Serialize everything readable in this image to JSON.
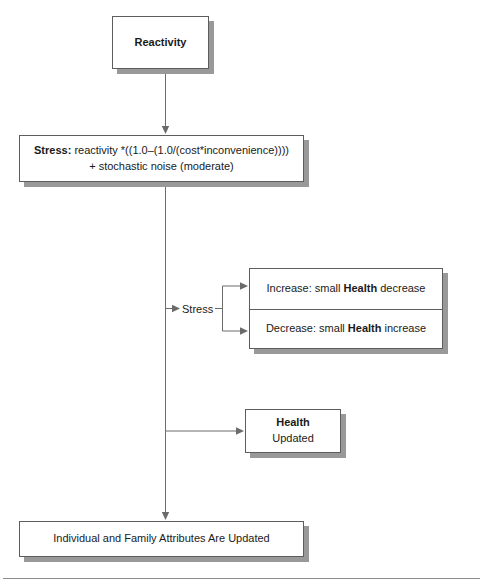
{
  "diagram": {
    "type": "flowchart",
    "nodes": {
      "reactivity": {
        "label": "Reactivity"
      },
      "stress_formula": {
        "line1_bold": "Stress:",
        "line1_rest": " reactivity *((1.0–(1.0/(cost*inconvenience))))",
        "line2": "+ stochastic noise (moderate)",
        "full_text": "Stress: reactivity *((1.0–(1.0/(cost*inconvenience)))) + stochastic noise (moderate)"
      },
      "branch_increase": {
        "prefix": "Increase: small ",
        "bold": "Health",
        "suffix": " decrease",
        "full_text": "Increase: small Health decrease"
      },
      "branch_decrease": {
        "prefix": "Decrease: small ",
        "bold": "Health",
        "suffix": " increase",
        "full_text": "Decrease: small Health increase"
      },
      "health_updated": {
        "bold": "Health",
        "suffix": " Updated",
        "full_text": "Health Updated"
      },
      "attributes_updated": {
        "label": "Individual and Family Attributes Are Updated"
      }
    },
    "connector_labels": {
      "stress_branch": "Stress"
    },
    "colors": {
      "box_border": "#5d5d5d",
      "box_fill": "#ffffff",
      "shadow": "#999999",
      "connector": "#6b6b6b",
      "text": "#1a1a1a",
      "rule": "#8d8d8d"
    }
  }
}
